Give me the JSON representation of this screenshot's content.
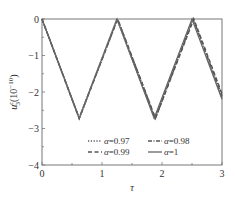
{
  "chart_data": {
    "type": "line",
    "title": "",
    "xlabel": "τ",
    "ylabel": "u₃ᶜ (10⁻¹⁰)",
    "ylabel_parts": {
      "main": "u",
      "sub": "3",
      "sup": "c",
      "unit": "(10",
      "unit_exp": "−10",
      "unit_close": ")"
    },
    "xlim": [
      0,
      3
    ],
    "ylim": [
      -4,
      0
    ],
    "xticks": [
      0,
      1,
      2,
      3
    ],
    "xtick_labels": [
      "0",
      "1",
      "2",
      "3"
    ],
    "x_minor_ticks": [
      0.5,
      1.5,
      2.5
    ],
    "yticks": [
      0,
      -1,
      -2,
      -3,
      -4
    ],
    "ytick_labels": [
      "0",
      "−1",
      "−2",
      "−3",
      "−4"
    ],
    "y_minor_ticks": [
      -0.5,
      -1.5,
      -2.5,
      -3.5
    ],
    "grid": false,
    "legend_position": "bottom-right",
    "series": [
      {
        "name": "α=0.97",
        "alpha_label": "α",
        "value_label": "=0.97",
        "style": "dotted",
        "color": "#555555",
        "x": [
          0,
          0.62,
          1.25,
          1.88,
          2.51,
          3.0
        ],
        "y": [
          0,
          -2.72,
          0,
          -2.72,
          0,
          -2.15
        ]
      },
      {
        "name": "α=0.98",
        "alpha_label": "α",
        "value_label": "=0.98",
        "style": "dashdot",
        "color": "#555555",
        "x": [
          0,
          0.62,
          1.26,
          1.89,
          2.52,
          3.0
        ],
        "y": [
          0,
          -2.72,
          0,
          -2.72,
          0,
          -2.1
        ]
      },
      {
        "name": "α=0.99",
        "alpha_label": "α",
        "value_label": "=0.99",
        "style": "dashed",
        "color": "#555555",
        "x": [
          0,
          0.62,
          1.26,
          1.89,
          2.53,
          3.0
        ],
        "y": [
          0,
          -2.72,
          0,
          -2.72,
          0,
          -2.05
        ]
      },
      {
        "name": "α=1",
        "alpha_label": "α",
        "value_label": "=1",
        "style": "solid",
        "color": "#666666",
        "x": [
          0,
          0.62,
          1.25,
          1.87,
          2.5,
          3.0
        ],
        "y": [
          0,
          -2.72,
          0,
          -2.72,
          0,
          -2.2
        ]
      }
    ]
  }
}
